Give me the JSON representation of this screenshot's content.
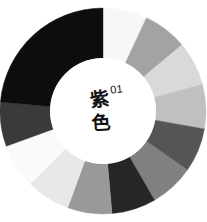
{
  "chart_data": {
    "type": "pie",
    "variant": "donut",
    "subtitle": "01",
    "xlabel": "",
    "ylabel": "",
    "legend": "none",
    "grid": false,
    "center_label": {
      "text_line_1": "紫",
      "text_line_2": "色",
      "superscript": "01"
    },
    "geometry": {
      "cx": 103,
      "cy": 111,
      "outer_radius": 103,
      "inner_radius": 53,
      "start_angle_deg": 0,
      "direction": "clockwise",
      "background": "#ffffff"
    },
    "categories": [
      "seg-01",
      "seg-02",
      "seg-03",
      "seg-04",
      "seg-05",
      "seg-06",
      "seg-07",
      "seg-08",
      "seg-09",
      "seg-10",
      "seg-11",
      "seg-12"
    ],
    "values": [
      25,
      25,
      25,
      25,
      25,
      25,
      25,
      25,
      25,
      25,
      25,
      150
    ],
    "colors": [
      "#f7f7f7",
      "#a3a3a3",
      "#d9d9d9",
      "#c0c0c0",
      "#555555",
      "#808080",
      "#262626",
      "#999999",
      "#e8e8e8",
      "#fafafa",
      "#3a3a3a",
      "#0d0d0d"
    ],
    "segments": [
      {
        "name": "seg-01",
        "label": "near-white",
        "color": "#f7f7f7",
        "start_deg": 0,
        "end_deg": 25,
        "sweep_deg": 25
      },
      {
        "name": "seg-02",
        "label": "medium-gray",
        "color": "#a3a3a3",
        "start_deg": 25,
        "end_deg": 50,
        "sweep_deg": 25
      },
      {
        "name": "seg-03",
        "label": "light-gray",
        "color": "#d9d9d9",
        "start_deg": 50,
        "end_deg": 75,
        "sweep_deg": 25
      },
      {
        "name": "seg-04",
        "label": "mid-light",
        "color": "#c0c0c0",
        "start_deg": 75,
        "end_deg": 100,
        "sweep_deg": 25
      },
      {
        "name": "seg-05",
        "label": "dark-gray",
        "color": "#555555",
        "start_deg": 100,
        "end_deg": 125,
        "sweep_deg": 25
      },
      {
        "name": "seg-06",
        "label": "mid-gray",
        "color": "#808080",
        "start_deg": 125,
        "end_deg": 150,
        "sweep_deg": 25
      },
      {
        "name": "seg-07",
        "label": "very-dark",
        "color": "#262626",
        "start_deg": 150,
        "end_deg": 175,
        "sweep_deg": 25
      },
      {
        "name": "seg-08",
        "label": "medium-gray-2",
        "color": "#999999",
        "start_deg": 175,
        "end_deg": 200,
        "sweep_deg": 25
      },
      {
        "name": "seg-09",
        "label": "light-gray-2",
        "color": "#e8e8e8",
        "start_deg": 200,
        "end_deg": 225,
        "sweep_deg": 25
      },
      {
        "name": "seg-10",
        "label": "near-white-2",
        "color": "#fafafa",
        "start_deg": 225,
        "end_deg": 250,
        "sweep_deg": 25
      },
      {
        "name": "seg-11",
        "label": "dark-gray-2",
        "color": "#3a3a3a",
        "start_deg": 250,
        "end_deg": 275,
        "sweep_deg": 25
      },
      {
        "name": "seg-12",
        "label": "black-arc",
        "color": "#0d0d0d",
        "start_deg": 275,
        "end_deg": 360,
        "sweep_deg": 85
      }
    ],
    "palette_name": "grayscale",
    "segment_count": 12
  }
}
